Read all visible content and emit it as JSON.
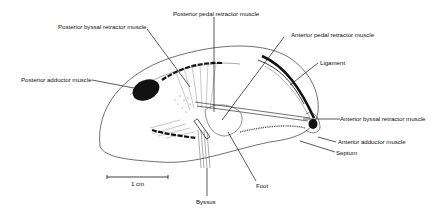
{
  "diagram": {
    "labels": {
      "posterior_pedal_retractor": "Posterior pedal retractor muscle",
      "posterior_byssal_retractor": "Posterior byssal retractor muscle",
      "anterior_pedal_retractor": "Anterior pedal retractor muscle",
      "ligament": "Ligament",
      "posterior_adductor": "Posterior adductor muscle",
      "anterior_byssal_retractor": "Anterior byssal retractor muscle",
      "anterior_adductor": "Anterior adductor muscle",
      "septum": "Septum",
      "foot": "Foot",
      "byssus": "Byssus"
    },
    "scale_bar": {
      "label": "1 cm"
    },
    "colors": {
      "ink": "#111111",
      "background": "#ffffff",
      "stipple": "#555555"
    }
  }
}
